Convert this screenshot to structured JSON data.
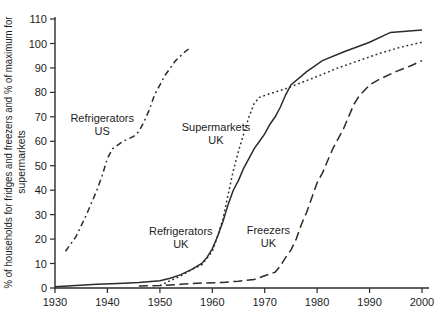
{
  "figure": {
    "background": "#ffffff",
    "axis_color": "#2b2b2b",
    "line_color": "#2b2b2b",
    "text_color": "#1c1c1c"
  },
  "chart_data": {
    "type": "line",
    "title": "",
    "xlabel": "",
    "ylabel": "% of households for fridges and freezers and % of maximum for supermarkets",
    "ylabel_lines": [
      "% of households for fridges and freezers and % of maximum for",
      "supermarkets"
    ],
    "xlim": [
      1930,
      2000
    ],
    "ylim": [
      0,
      110
    ],
    "x_ticks": [
      1930,
      1940,
      1950,
      1960,
      1970,
      1980,
      1990,
      2000
    ],
    "y_ticks": [
      0,
      10,
      20,
      30,
      40,
      50,
      60,
      70,
      80,
      90,
      100,
      110
    ],
    "grid": false,
    "legend_position": "inline-annotations",
    "series": [
      {
        "name": "Refrigerators US",
        "style": "dash-dot",
        "annotation": {
          "lines": [
            "Refrigerators",
            "US"
          ],
          "x": 1939,
          "y": 67
        },
        "points": [
          [
            1932,
            15
          ],
          [
            1934,
            21
          ],
          [
            1936,
            30
          ],
          [
            1938,
            40
          ],
          [
            1939,
            46
          ],
          [
            1940,
            53
          ],
          [
            1941,
            57
          ],
          [
            1943,
            60
          ],
          [
            1945,
            62
          ],
          [
            1946,
            64
          ],
          [
            1947,
            68
          ],
          [
            1948,
            73
          ],
          [
            1949,
            79
          ],
          [
            1951,
            87
          ],
          [
            1953,
            93
          ],
          [
            1955,
            97
          ],
          [
            1956,
            98.5
          ]
        ]
      },
      {
        "name": "Supermarkets UK",
        "style": "dotted",
        "annotation": {
          "lines": [
            "Supermarkets",
            "UK"
          ],
          "x": 1960.7,
          "y": 63
        },
        "points": [
          [
            1950,
            1
          ],
          [
            1952,
            3
          ],
          [
            1954,
            5
          ],
          [
            1956,
            7.5
          ],
          [
            1958,
            9.5
          ],
          [
            1960,
            15
          ],
          [
            1961,
            21
          ],
          [
            1962,
            28
          ],
          [
            1963,
            38
          ],
          [
            1964,
            48
          ],
          [
            1965,
            56
          ],
          [
            1966,
            63
          ],
          [
            1967,
            70
          ],
          [
            1968,
            75.5
          ],
          [
            1969,
            78
          ],
          [
            1971,
            79.5
          ],
          [
            1974,
            81.5
          ],
          [
            1977,
            84
          ],
          [
            1980,
            86.5
          ],
          [
            1984,
            90
          ],
          [
            1988,
            93
          ],
          [
            1992,
            96
          ],
          [
            1996,
            98.5
          ],
          [
            2000,
            100.5
          ]
        ]
      },
      {
        "name": "Refrigerators UK",
        "style": "solid",
        "annotation": {
          "lines": [
            "Refrigerators",
            "UK"
          ],
          "x": 1954,
          "y": 20.5
        },
        "points": [
          [
            1930,
            0.5
          ],
          [
            1934,
            1
          ],
          [
            1938,
            1.5
          ],
          [
            1942,
            1.8
          ],
          [
            1946,
            2.2
          ],
          [
            1950,
            3
          ],
          [
            1952,
            4
          ],
          [
            1954,
            5.5
          ],
          [
            1956,
            7.5
          ],
          [
            1958,
            10
          ],
          [
            1959,
            12.5
          ],
          [
            1960,
            16
          ],
          [
            1961,
            21
          ],
          [
            1962,
            27
          ],
          [
            1963,
            34
          ],
          [
            1964,
            40
          ],
          [
            1965,
            44
          ],
          [
            1966,
            49
          ],
          [
            1967,
            53
          ],
          [
            1968,
            57
          ],
          [
            1969,
            60
          ],
          [
            1970,
            63
          ],
          [
            1971,
            67
          ],
          [
            1972,
            70
          ],
          [
            1973,
            74
          ],
          [
            1974,
            79
          ],
          [
            1975,
            83
          ],
          [
            1978,
            88.5
          ],
          [
            1981,
            93
          ],
          [
            1985,
            96.5
          ],
          [
            1990,
            100.5
          ],
          [
            1994,
            104.5
          ],
          [
            2000,
            105.5
          ]
        ]
      },
      {
        "name": "Freezers UK",
        "style": "dashed",
        "annotation": {
          "lines": [
            "Freezers",
            "UK"
          ],
          "x": 1970.7,
          "y": 21
        },
        "points": [
          [
            1946,
            0.8
          ],
          [
            1950,
            1
          ],
          [
            1954,
            1.5
          ],
          [
            1958,
            2
          ],
          [
            1962,
            2.3
          ],
          [
            1965,
            2.8
          ],
          [
            1968,
            3.5
          ],
          [
            1970,
            5
          ],
          [
            1972,
            6.5
          ],
          [
            1973,
            9
          ],
          [
            1974,
            12.5
          ],
          [
            1975,
            15.5
          ],
          [
            1976,
            20
          ],
          [
            1977,
            26
          ],
          [
            1978,
            31
          ],
          [
            1979,
            37
          ],
          [
            1980,
            43
          ],
          [
            1981,
            47
          ],
          [
            1982,
            52
          ],
          [
            1983,
            57
          ],
          [
            1984,
            61
          ],
          [
            1985,
            65
          ],
          [
            1986,
            70
          ],
          [
            1987,
            75
          ],
          [
            1988,
            78.5
          ],
          [
            1990,
            83
          ],
          [
            1992,
            85.5
          ],
          [
            1995,
            88.5
          ],
          [
            1998,
            91
          ],
          [
            2000,
            93
          ]
        ]
      }
    ]
  }
}
